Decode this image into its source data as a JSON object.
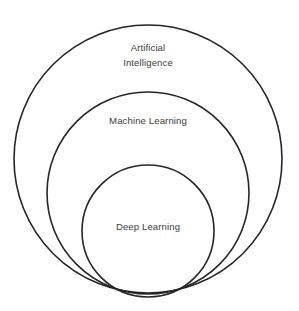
{
  "diagram": {
    "type": "nested-venn",
    "background_color": "#ffffff",
    "stroke_color": "#262626",
    "text_color": "#3d3d3d",
    "circles": [
      {
        "id": "artificial-intelligence",
        "label_line1": "Artificial",
        "label_line2": "Intelligence",
        "cx": 148,
        "cy": 159,
        "r": 134,
        "label_x": 148,
        "label_y": 51,
        "label_y2": 66
      },
      {
        "id": "machine-learning",
        "label_line1": "Machine Learning",
        "label_line2": "",
        "cx": 148,
        "cy": 193,
        "r": 101,
        "label_x": 148,
        "label_y": 124,
        "label_y2": 0
      },
      {
        "id": "deep-learning",
        "label_line1": "Deep Learning",
        "label_line2": "",
        "cx": 148,
        "cy": 231,
        "r": 66,
        "label_x": 148,
        "label_y": 230,
        "label_y2": 0
      }
    ]
  }
}
